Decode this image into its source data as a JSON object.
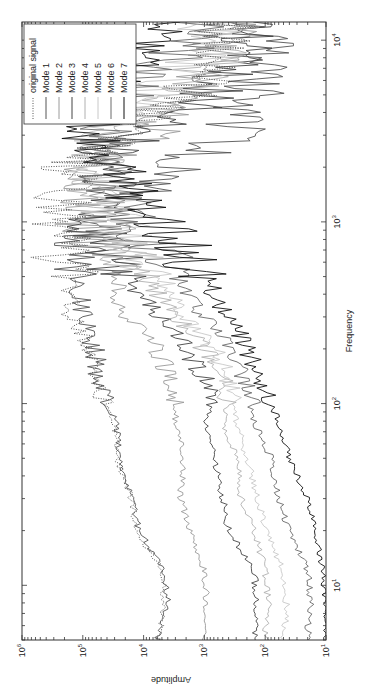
{
  "chart_data": {
    "type": "line",
    "title": "",
    "xlabel": "Frequency",
    "ylabel": "Amplitude",
    "xscale": "log",
    "yscale": "log",
    "xlim": [
      5,
      12589
    ],
    "ylim": [
      10,
      1000000
    ],
    "x_ticks": [
      "10^1",
      "10^2",
      "10^3",
      "10^4"
    ],
    "y_ticks": [
      "10^1",
      "10^2",
      "10^3",
      "10^4",
      "10^5",
      "10^6"
    ],
    "grid": false,
    "legend_position": "upper right",
    "orientation_note": "figure rendered rotated 90 degrees counter-clockwise",
    "x": [
      5,
      8,
      12,
      20,
      30,
      50,
      80,
      120,
      200,
      300,
      500,
      800,
      1200,
      2000,
      3000,
      5000,
      8000,
      12000
    ],
    "series": [
      {
        "name": "original signal",
        "style": "dotted",
        "color": "#555555",
        "values": [
          5500,
          4500,
          5000,
          13000,
          16000,
          28000,
          30000,
          60000,
          70000,
          150000,
          180000,
          250000,
          220000,
          150000,
          30000,
          2000,
          500,
          400
        ]
      },
      {
        "name": "Mode 1",
        "style": "solid",
        "color": "#555555",
        "values": [
          6000,
          4000,
          4500,
          12000,
          15000,
          25000,
          28000,
          55000,
          65000,
          100000,
          120000,
          80000,
          30000,
          3000,
          400,
          150,
          120,
          120
        ]
      },
      {
        "name": "Mode 2",
        "style": "solid",
        "color": "#9a9a9a",
        "values": [
          1000,
          900,
          1000,
          1700,
          2500,
          2200,
          3000,
          3000,
          6000,
          20000,
          30000,
          70000,
          100000,
          60000,
          10000,
          1500,
          600,
          400
        ]
      },
      {
        "name": "Mode 3",
        "style": "solid",
        "color": "#444444",
        "values": [
          150,
          140,
          150,
          400,
          500,
          700,
          900,
          800,
          2000,
          5000,
          20000,
          60000,
          80000,
          40000,
          8000,
          900,
          300,
          200
        ]
      },
      {
        "name": "Mode 4",
        "style": "solid",
        "color": "#b0b0b0",
        "values": [
          100,
          90,
          100,
          150,
          250,
          300,
          500,
          400,
          1000,
          3000,
          10000,
          30000,
          50000,
          70000,
          30000,
          3000,
          600,
          400
        ]
      },
      {
        "name": "Mode 5",
        "style": "solid",
        "color": "#c8c8c8",
        "values": [
          50,
          45,
          50,
          100,
          130,
          200,
          300,
          350,
          700,
          2000,
          5000,
          20000,
          40000,
          60000,
          50000,
          6000,
          1500,
          800
        ]
      },
      {
        "name": "Mode 6",
        "style": "solid",
        "color": "#6a6a6a",
        "values": [
          20,
          18,
          20,
          40,
          60,
          80,
          150,
          200,
          400,
          1000,
          3000,
          8000,
          20000,
          40000,
          60000,
          20000,
          3000,
          1500
        ]
      },
      {
        "name": "Mode 7",
        "style": "solid",
        "color": "#111111",
        "values": [
          10,
          10,
          11,
          15,
          20,
          40,
          60,
          100,
          200,
          400,
          1000,
          3000,
          10000,
          30000,
          80000,
          60000,
          15000,
          3000
        ]
      }
    ]
  },
  "axes": {
    "xlabel": "Frequency",
    "ylabel": "Amplitude",
    "x_tick_labels": [
      {
        "base": "10",
        "exp": "1"
      },
      {
        "base": "10",
        "exp": "2"
      },
      {
        "base": "10",
        "exp": "3"
      },
      {
        "base": "10",
        "exp": "4"
      }
    ],
    "y_tick_labels": [
      {
        "base": "10",
        "exp": "1"
      },
      {
        "base": "10",
        "exp": "2"
      },
      {
        "base": "10",
        "exp": "3"
      },
      {
        "base": "10",
        "exp": "4"
      },
      {
        "base": "10",
        "exp": "5"
      },
      {
        "base": "10",
        "exp": "6"
      }
    ]
  },
  "legend": {
    "items": [
      {
        "label": "original signal",
        "style": "dotted",
        "color": "#555555"
      },
      {
        "label": "Mode 1",
        "style": "solid",
        "color": "#555555"
      },
      {
        "label": "Mode 2",
        "style": "solid",
        "color": "#9a9a9a"
      },
      {
        "label": "Mode 3",
        "style": "solid",
        "color": "#444444"
      },
      {
        "label": "Mode 4",
        "style": "solid",
        "color": "#b0b0b0"
      },
      {
        "label": "Mode 5",
        "style": "solid",
        "color": "#c8c8c8"
      },
      {
        "label": "Mode 6",
        "style": "solid",
        "color": "#6a6a6a"
      },
      {
        "label": "Mode 7",
        "style": "solid",
        "color": "#111111"
      }
    ]
  }
}
